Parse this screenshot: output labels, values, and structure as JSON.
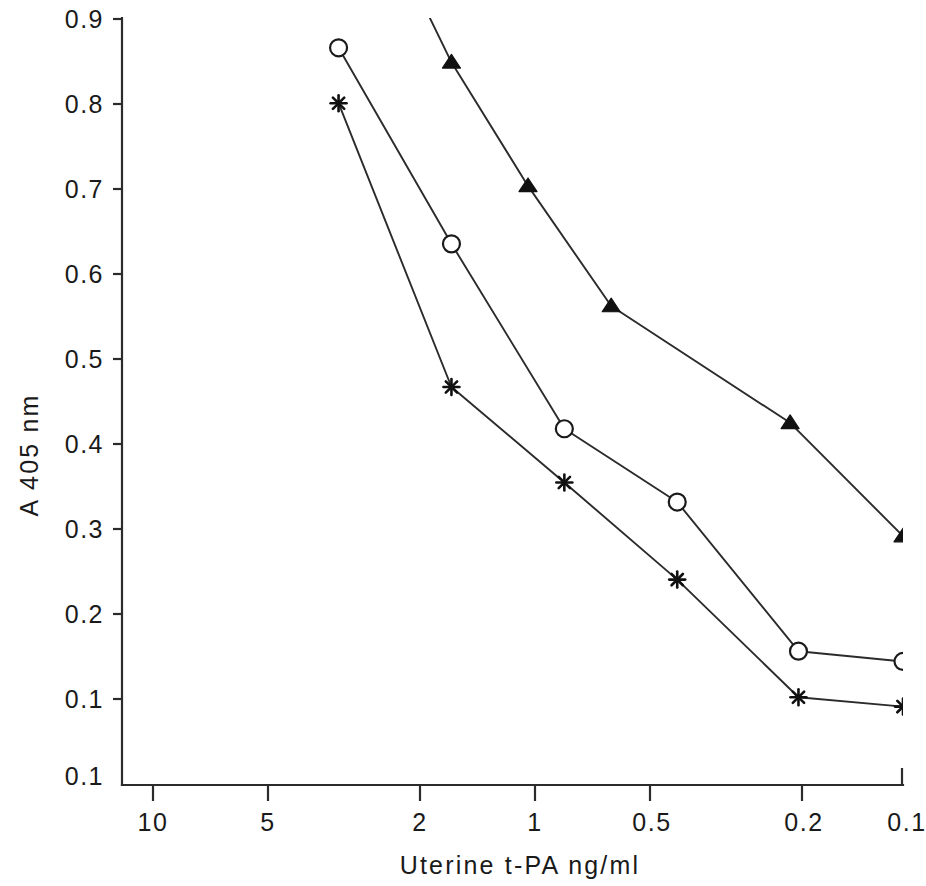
{
  "figure": {
    "background_color": "#ffffff",
    "ink_color": "#1a1a1a"
  },
  "chart_data": {
    "type": "line",
    "title": "",
    "subtitle": "",
    "xlabel": "Uterine t-PA  ng/ml",
    "ylabel": "A 405 nm",
    "x_scale": "log-reversed",
    "xlim": [
      10,
      0.1
    ],
    "ylim": [
      0.0,
      0.9
    ],
    "grid": false,
    "legend": "none",
    "x_tick_labels": [
      "10",
      "5",
      "2",
      "1",
      "0.5",
      "0.2",
      "0.1"
    ],
    "x_tick_values": [
      10,
      5,
      2,
      1,
      0.5,
      0.2,
      0.1
    ],
    "y_tick_labels": [
      "0.9",
      "0.8",
      "0.7",
      "0.6",
      "0.5",
      "0.4",
      "0.3",
      "0.2",
      "0.1",
      "0.1"
    ],
    "y_tick_values": [
      0.9,
      0.8,
      0.7,
      0.6,
      0.5,
      0.4,
      0.3,
      0.2,
      0.1,
      0.0
    ],
    "series": [
      {
        "name": "filled-triangle-series",
        "marker": "filled-triangle",
        "x": [
          1.6,
          1.0,
          0.6,
          0.2,
          0.1
        ],
        "values": [
          0.848,
          0.703,
          0.562,
          0.425,
          0.292
        ],
        "line_extends_above_axis": true,
        "lead_in_x": 1.85,
        "lead_in_y": 0.905
      },
      {
        "name": "open-circle-series",
        "marker": "open-circle",
        "x": [
          3.2,
          1.6,
          0.8,
          0.4,
          0.19,
          0.1
        ],
        "values": [
          0.865,
          0.635,
          0.418,
          0.332,
          0.157,
          0.145
        ]
      },
      {
        "name": "asterisk-series",
        "marker": "asterisk",
        "x": [
          3.2,
          1.6,
          0.8,
          0.4,
          0.19,
          0.1
        ],
        "values": [
          0.8,
          0.467,
          0.355,
          0.241,
          0.103,
          0.092
        ]
      }
    ]
  }
}
